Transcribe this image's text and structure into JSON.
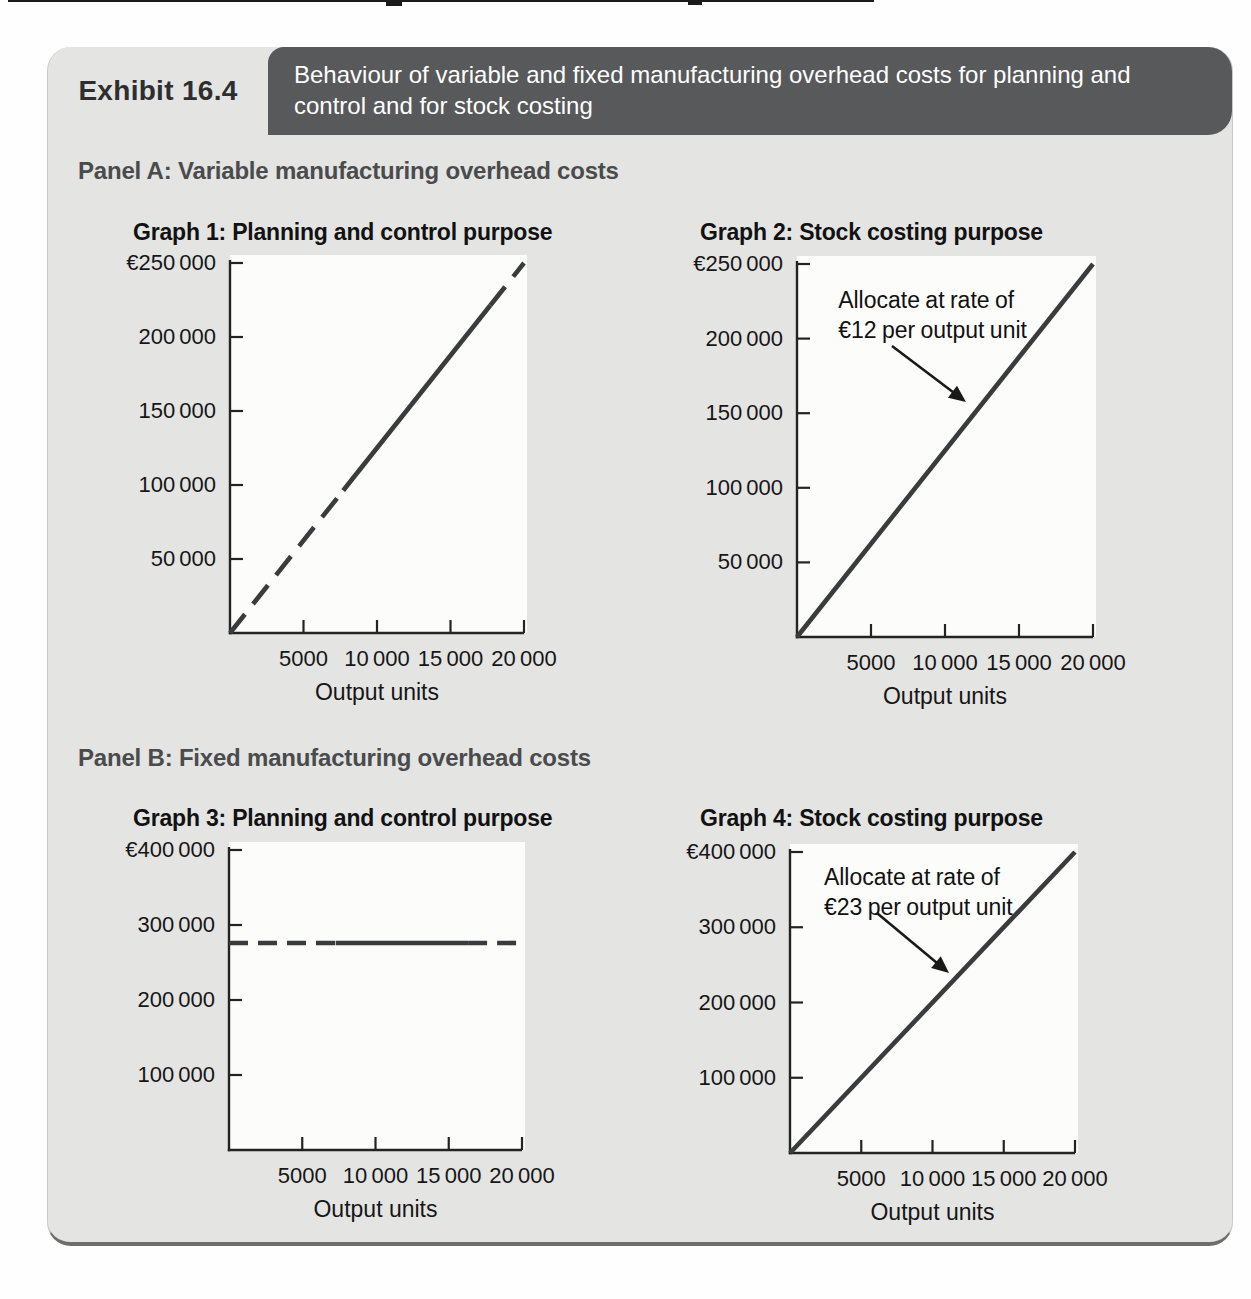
{
  "exhibit": {
    "label": "Exhibit 16.4",
    "title_lines": [
      "Behaviour of variable and fixed manufacturing overhead costs for planning and",
      "control and for stock costing"
    ]
  },
  "panels": [
    {
      "label": "Panel A: Variable manufacturing overhead costs"
    },
    {
      "label": "Panel B: Fixed manufacturing overhead costs"
    }
  ],
  "colors": {
    "header_bar": "#58595b",
    "card_background": "#e4e4e3",
    "plot_background": "#fcfcfb",
    "axis": "#232323",
    "cost_line": "#3a3b3d",
    "arrow": "#191919",
    "text": "#161616"
  },
  "chart_data": [
    {
      "type": "line",
      "panel": "A",
      "title": "Graph 1: Planning and control purpose",
      "xlabel": "Output units",
      "xlim": [
        0,
        20000
      ],
      "ylim": [
        0,
        250000
      ],
      "x_ticks": [
        5000,
        10000,
        15000,
        20000
      ],
      "x_tick_labels": [
        "5000",
        "10 000",
        "15 000",
        "20 000"
      ],
      "y_ticks": [
        250000,
        200000,
        150000,
        100000,
        50000
      ],
      "y_tick_labels": [
        "€250 000",
        "200 000",
        "150 000",
        "100 000",
        "50 000"
      ],
      "line": {
        "kind": "diagonal",
        "from": [
          0,
          0
        ],
        "to": [
          20000,
          250000
        ],
        "style": "dashed-ends",
        "solid_span": [
          0.385,
          0.885
        ],
        "dash": "24 13"
      }
    },
    {
      "type": "line",
      "panel": "A",
      "title": "Graph 2: Stock costing purpose",
      "xlabel": "Output units",
      "xlim": [
        0,
        20000
      ],
      "ylim": [
        0,
        250000
      ],
      "x_ticks": [
        5000,
        10000,
        15000,
        20000
      ],
      "x_tick_labels": [
        "5000",
        "10 000",
        "15 000",
        "20 000"
      ],
      "y_ticks": [
        250000,
        200000,
        150000,
        100000,
        50000
      ],
      "y_tick_labels": [
        "€250 000",
        "200 000",
        "150 000",
        "100 000",
        "50 000"
      ],
      "line": {
        "kind": "diagonal",
        "from": [
          0,
          0
        ],
        "to": [
          20000,
          250000
        ],
        "style": "solid"
      },
      "annotation": {
        "lines": [
          "Allocate at rate of",
          "€12 per output unit"
        ],
        "allocation_rate_eur_per_unit": 12,
        "text_frac": [
          0.139,
          0.056
        ],
        "arrow_from": [
          0.321,
          0.22
        ],
        "arrow_to": [
          0.571,
          0.37
        ]
      }
    },
    {
      "type": "line",
      "panel": "B",
      "title": "Graph 3: Planning and control purpose",
      "xlabel": "Output units",
      "xlim": [
        0,
        20000
      ],
      "ylim": [
        0,
        400000
      ],
      "x_ticks": [
        5000,
        10000,
        15000,
        20000
      ],
      "x_tick_labels": [
        "5000",
        "10 000",
        "15 000",
        "20 000"
      ],
      "y_ticks": [
        400000,
        300000,
        200000,
        100000
      ],
      "y_tick_labels": [
        "€400 000",
        "300 000",
        "200 000",
        "100 000"
      ],
      "line": {
        "kind": "flat",
        "value": 276000,
        "style": "dashed-ends",
        "solid_span": [
          0.364,
          0.816
        ],
        "dash": "19 10"
      }
    },
    {
      "type": "line",
      "panel": "B",
      "title": "Graph 4: Stock costing purpose",
      "xlabel": "Output units",
      "xlim": [
        0,
        20000
      ],
      "ylim": [
        0,
        400000
      ],
      "x_ticks": [
        5000,
        10000,
        15000,
        20000
      ],
      "x_tick_labels": [
        "5000",
        "10 000",
        "15 000",
        "20 000"
      ],
      "y_ticks": [
        400000,
        300000,
        200000,
        100000
      ],
      "y_tick_labels": [
        "€400 000",
        "300 000",
        "200 000",
        "100 000"
      ],
      "line": {
        "kind": "diagonal",
        "from": [
          0,
          0
        ],
        "to": [
          20000,
          400000
        ],
        "style": "solid"
      },
      "annotation": {
        "lines": [
          "Allocate at rate of",
          "€23 per output unit"
        ],
        "allocation_rate_eur_per_unit": 23,
        "text_frac": [
          0.119,
          0.033
        ],
        "arrow_from": [
          0.305,
          0.203
        ],
        "arrow_to": [
          0.558,
          0.402
        ]
      }
    }
  ]
}
